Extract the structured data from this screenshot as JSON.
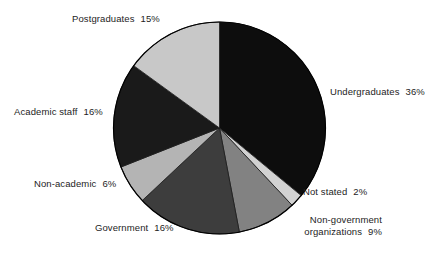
{
  "chart_data": {
    "type": "pie",
    "title": "",
    "legend_position": "labels-around-pie",
    "grid": false,
    "categories": [
      "Undergraduates",
      "Not stated",
      "Non-government organizations",
      "Government",
      "Non-academic",
      "Academic staff",
      "Postgraduates"
    ],
    "values": [
      36,
      2,
      9,
      16,
      6,
      16,
      15
    ],
    "unit": "%",
    "slices": [
      {
        "label": "Undergraduates",
        "value": 36,
        "value_text": "36%",
        "color": "#0d0d0d",
        "start_angle": 0,
        "end_angle": 129.6
      },
      {
        "label": "Not stated",
        "value": 2,
        "value_text": "2%",
        "color": "#d2d2d2",
        "start_angle": 129.6,
        "end_angle": 136.8
      },
      {
        "label": "Non-government organizations",
        "value": 9,
        "value_text": "9%",
        "color": "#828282",
        "start_angle": 136.8,
        "end_angle": 169.2
      },
      {
        "label": "Government",
        "value": 16,
        "value_text": "16%",
        "color": "#3d3d3d",
        "start_angle": 169.2,
        "end_angle": 226.8
      },
      {
        "label": "Non-academic",
        "value": 6,
        "value_text": "6%",
        "color": "#b4b4b4",
        "start_angle": 226.8,
        "end_angle": 248.4
      },
      {
        "label": "Academic staff",
        "value": 16,
        "value_text": "16%",
        "color": "#1a1a1a",
        "start_angle": 248.4,
        "end_angle": 306.0
      },
      {
        "label": "Postgraduates",
        "value": 15,
        "value_text": "15%",
        "color": "#c8c8c8",
        "start_angle": 306.0,
        "end_angle": 360.0
      }
    ]
  },
  "labels": {
    "postgraduates": {
      "name": "Postgraduates",
      "pct": "15%"
    },
    "undergraduates": {
      "name": "Undergraduates",
      "pct": "36%"
    },
    "academic_staff": {
      "name": "Academic staff",
      "pct": "16%"
    },
    "non_academic": {
      "name": "Non-academic",
      "pct": "6%"
    },
    "government": {
      "name": "Government",
      "pct": "16%"
    },
    "ngo": {
      "name_line1": "Non-government",
      "name_line2": "organizations",
      "pct": "9%"
    },
    "not_stated": {
      "name": "Not stated",
      "pct": "2%"
    }
  },
  "style": {
    "background": "#ffffff",
    "outline": "#000000",
    "text_color": "#1d1d1d"
  }
}
